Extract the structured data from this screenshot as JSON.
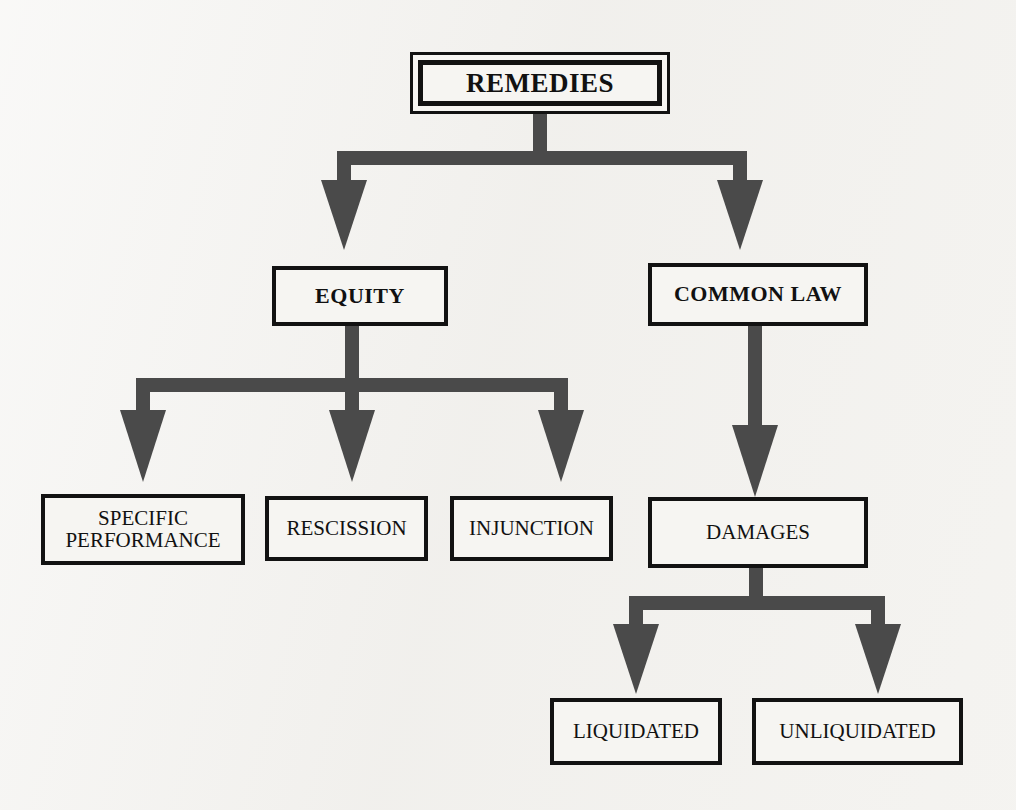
{
  "diagram": {
    "title": "Remedies",
    "type": "hierarchy-tree",
    "orientation": "top-down",
    "background_color": "#f2f1ee",
    "box_border_color": "#121212",
    "box_fill_color": "#f6f5f2",
    "connector_color": "#4a4a4a",
    "text_color": "#111111",
    "levels": 4,
    "nodes": [
      {
        "id": "remedies",
        "label": "REMEDIES",
        "level": 0,
        "style": "double-border",
        "bold": true,
        "x": 410,
        "y": 52,
        "w": 260,
        "h": 62,
        "font_size": 27
      },
      {
        "id": "equity",
        "label": "EQUITY",
        "level": 1,
        "style": "single-border",
        "bold": true,
        "parent": "remedies",
        "x": 272,
        "y": 266,
        "w": 176,
        "h": 60,
        "font_size": 22
      },
      {
        "id": "common-law",
        "label": "COMMON LAW",
        "level": 1,
        "style": "single-border",
        "bold": true,
        "parent": "remedies",
        "x": 648,
        "y": 263,
        "w": 220,
        "h": 63,
        "font_size": 22
      },
      {
        "id": "specific-performance",
        "label": "SPECIFIC\nPERFORMANCE",
        "level": 2,
        "style": "single-border",
        "bold": false,
        "parent": "equity",
        "x": 41,
        "y": 494,
        "w": 204,
        "h": 71,
        "font_size": 21
      },
      {
        "id": "rescission",
        "label": "RESCISSION",
        "level": 2,
        "style": "single-border",
        "bold": false,
        "parent": "equity",
        "x": 265,
        "y": 496,
        "w": 163,
        "h": 65,
        "font_size": 21
      },
      {
        "id": "injunction",
        "label": "INJUNCTION",
        "level": 2,
        "style": "single-border",
        "bold": false,
        "parent": "equity",
        "x": 450,
        "y": 496,
        "w": 163,
        "h": 65,
        "font_size": 21
      },
      {
        "id": "damages",
        "label": "DAMAGES",
        "level": 2,
        "style": "single-border",
        "bold": false,
        "parent": "common-law",
        "x": 648,
        "y": 497,
        "w": 220,
        "h": 71,
        "font_size": 21
      },
      {
        "id": "liquidated",
        "label": "LIQUIDATED",
        "level": 3,
        "style": "single-border",
        "bold": false,
        "parent": "damages",
        "x": 550,
        "y": 698,
        "w": 172,
        "h": 67,
        "font_size": 21
      },
      {
        "id": "unliquidated",
        "label": "UNLIQUIDATED",
        "level": 3,
        "style": "single-border",
        "bold": false,
        "parent": "damages",
        "x": 752,
        "y": 698,
        "w": 211,
        "h": 67,
        "font_size": 21
      }
    ],
    "edges": [
      {
        "from": "remedies",
        "to": "equity",
        "kind": "elbow-block-arrow"
      },
      {
        "from": "remedies",
        "to": "common-law",
        "kind": "elbow-block-arrow"
      },
      {
        "from": "equity",
        "to": "specific-performance",
        "kind": "elbow-block-arrow"
      },
      {
        "from": "equity",
        "to": "rescission",
        "kind": "straight-block-arrow"
      },
      {
        "from": "equity",
        "to": "injunction",
        "kind": "elbow-block-arrow"
      },
      {
        "from": "common-law",
        "to": "damages",
        "kind": "straight-block-arrow"
      },
      {
        "from": "damages",
        "to": "liquidated",
        "kind": "elbow-block-arrow"
      },
      {
        "from": "damages",
        "to": "unliquidated",
        "kind": "elbow-block-arrow"
      }
    ]
  }
}
